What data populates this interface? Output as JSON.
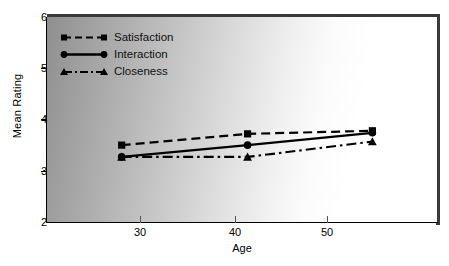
{
  "chart_data": {
    "type": "line",
    "title": "",
    "xlabel": "Age",
    "ylabel": "Mean Rating",
    "x": [
      28.7,
      40.0,
      51.2
    ],
    "xlim": [
      22.0,
      57.0
    ],
    "ylim": [
      2,
      6
    ],
    "x_ticks": [
      30,
      40,
      50
    ],
    "x_tick_labels": [
      "30",
      "40",
      "50"
    ],
    "y_ticks": [
      2,
      3,
      4,
      5,
      6
    ],
    "y_tick_labels": [
      "2",
      "3",
      "4",
      "5",
      "6"
    ],
    "grid": false,
    "legend_position": "upper left",
    "series": [
      {
        "name": "Satisfaction",
        "values": [
          3.5,
          3.72,
          3.78
        ],
        "marker": "square",
        "linestyle": "dashed",
        "color": "#000000"
      },
      {
        "name": "Interaction",
        "values": [
          3.27,
          3.5,
          3.74
        ],
        "marker": "circle",
        "linestyle": "solid",
        "color": "#000000"
      },
      {
        "name": "Closeness",
        "values": [
          3.27,
          3.27,
          3.57
        ],
        "marker": "triangle",
        "linestyle": "dash-dot",
        "color": "#000000"
      }
    ]
  },
  "axes": {
    "y_label": "Mean Rating",
    "x_label": "Age",
    "y_tick_labels": [
      "6",
      "5",
      "4",
      "3",
      "2"
    ],
    "x_tick_labels": [
      "30",
      "40",
      "50"
    ]
  },
  "legend": {
    "items": [
      {
        "label": "Satisfaction"
      },
      {
        "label": "Interaction"
      },
      {
        "label": "Closeness"
      }
    ]
  },
  "colors": {
    "line": "#000000",
    "axis": "#000000",
    "panel_edge": "#3a3a3a",
    "background": "#ffffff",
    "gradient_dark": "#8f8f8f",
    "gradient_light": "#ffffff"
  }
}
